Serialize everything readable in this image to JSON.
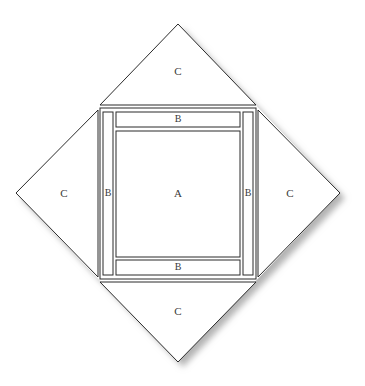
{
  "figure": {
    "canvas": {
      "width": 365,
      "height": 386
    },
    "background_color": "#ffffff",
    "stroke_color": "#2b2b2b",
    "fill_color": "#ffffff",
    "shadow_color": "#b9b9b9",
    "text_color": "#3a3a3a",
    "stroke_width": 1
  },
  "geometry": {
    "diamond": {
      "name": "outer-diamond",
      "vertices": {
        "top": {
          "x": 178,
          "y": 24
        },
        "right": {
          "x": 340,
          "y": 193
        },
        "bottom": {
          "x": 178,
          "y": 362
        },
        "left": {
          "x": 16,
          "y": 193
        }
      }
    },
    "outer_frame": {
      "name": "outer-square-frame",
      "left": 100,
      "top": 108,
      "right": 256,
      "bottom": 279
    },
    "inner_square": {
      "name": "inner-square-a",
      "left": 118,
      "top": 133,
      "right": 238,
      "bottom": 255
    },
    "strips": {
      "top": {
        "left": 113,
        "top": 113,
        "right": 243,
        "bottom": 128
      },
      "bottom": {
        "left": 113,
        "top": 260,
        "right": 243,
        "bottom": 275
      },
      "left": {
        "left": 103,
        "top": 113,
        "right": 113,
        "bottom": 275
      },
      "right": {
        "left": 243,
        "top": 113,
        "right": 253,
        "bottom": 275
      }
    }
  },
  "labels": {
    "center": {
      "text": "A",
      "x": 178,
      "y": 193
    },
    "strip_top": {
      "text": "B",
      "x": 178,
      "y": 120
    },
    "strip_bottom": {
      "text": "B",
      "x": 178,
      "y": 267
    },
    "strip_left": {
      "text": "B",
      "x": 107,
      "y": 193
    },
    "strip_right": {
      "text": "B",
      "x": 249,
      "y": 193
    },
    "triangle_top": {
      "text": "C",
      "x": 178,
      "y": 71
    },
    "triangle_bottom": {
      "text": "C",
      "x": 178,
      "y": 311
    },
    "triangle_left": {
      "text": "C",
      "x": 64,
      "y": 193
    },
    "triangle_right": {
      "text": "C",
      "x": 288,
      "y": 193
    }
  },
  "regions": [
    {
      "id": "A",
      "role": "inner-square",
      "label": "A"
    },
    {
      "id": "B-top",
      "role": "border-strip",
      "label": "B"
    },
    {
      "id": "B-bottom",
      "role": "border-strip",
      "label": "B"
    },
    {
      "id": "B-left",
      "role": "border-strip",
      "label": "B"
    },
    {
      "id": "B-right",
      "role": "border-strip",
      "label": "B"
    },
    {
      "id": "C-top",
      "role": "corner-triangle",
      "label": "C"
    },
    {
      "id": "C-bottom",
      "role": "corner-triangle",
      "label": "C"
    },
    {
      "id": "C-left",
      "role": "corner-triangle",
      "label": "C"
    },
    {
      "id": "C-right",
      "role": "corner-triangle",
      "label": "C"
    }
  ]
}
